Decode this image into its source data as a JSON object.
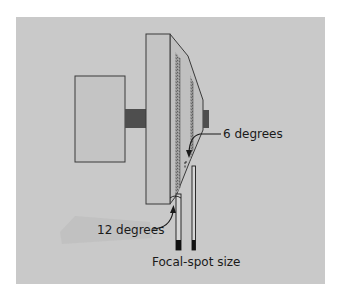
{
  "diagram": {
    "type": "line-focus principle (rotating anode target angle)",
    "labels": {
      "angle_small": "6 degrees",
      "angle_large": "12 degrees",
      "focal_spot": "Focal-spot size"
    },
    "colors": {
      "page_bg": "#ffffff",
      "panel_bg": "#c9c9c9",
      "shape_fill": "#c2c2c2",
      "outline": "#3a3a3a",
      "shaft": "#4e4e4e",
      "stipple": "#7a7a7a",
      "text": "#1a1a1a"
    },
    "components": [
      {
        "id": "rotor",
        "name": "Rotor block"
      },
      {
        "id": "stem",
        "name": "Shaft"
      },
      {
        "id": "anode-disk",
        "name": "Anode disk"
      },
      {
        "id": "target-bevel",
        "name": "Beveled target face"
      },
      {
        "id": "hub-stub",
        "name": "Hub stub"
      },
      {
        "id": "beam-small",
        "name": "Effective focal spot (6 degrees)"
      },
      {
        "id": "beam-large",
        "name": "Effective focal spot (12 degrees)"
      }
    ]
  }
}
